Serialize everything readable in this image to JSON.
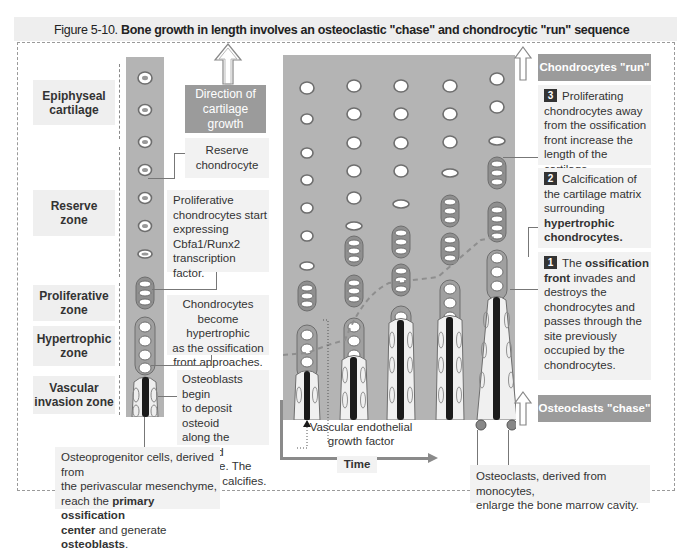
{
  "figure": {
    "number": "Figure 5-10.",
    "title": "Bone growth in length involves an osteoclastic \"chase\" and chondrocytic \"run\" sequence"
  },
  "zones": [
    {
      "id": "epiphyseal",
      "label_line1": "Epiphyseal",
      "label_line2": "cartilage"
    },
    {
      "id": "reserve",
      "label_line1": "Reserve",
      "label_line2": "zone"
    },
    {
      "id": "proliferative",
      "label_line1": "Proliferative",
      "label_line2": "zone"
    },
    {
      "id": "hypertrophic",
      "label_line1": "Hypertrophic",
      "label_line2": "zone"
    },
    {
      "id": "vascular",
      "label_line1": "Vascular",
      "label_line2": "invasion zone"
    }
  ],
  "direction_box": {
    "line1": "Direction of",
    "line2": "cartilage",
    "line3": "growth"
  },
  "callouts": {
    "reserve_chondrocyte": {
      "line1": "Reserve",
      "line2": "chondrocyte"
    },
    "proliferative": [
      "Proliferative",
      "chondrocytes start",
      "expressing",
      "Cbfa1/Runx2",
      "transcription factor."
    ],
    "hypertrophic": [
      "Chondrocytes",
      "become hypertrophic",
      "as the ossification",
      "front approaches."
    ],
    "osteoblasts": [
      "Osteoblasts begin",
      "to deposit osteoid",
      "along the calcified",
      "cartilage. The",
      "osteoid calcifies."
    ],
    "osteoprogenitor": {
      "line1": "Osteoprogenitor cells, derived from",
      "line2": "the perivascular mesenchyme,",
      "line3_pre": "reach the ",
      "line3_bold": "primary ossification",
      "line4_bold": "center",
      "line4_mid": " and generate ",
      "line4_bold2": "osteoblasts",
      "line4_end": "."
    },
    "vegf": {
      "line1": "Vascular endothelial",
      "line2": "growth factor"
    },
    "osteoclasts": {
      "line1": "Osteoclasts, derived from monocytes,",
      "line2": "enlarge the bone marrow cavity."
    }
  },
  "time_axis": {
    "label": "Time"
  },
  "right_panel": {
    "run_header": "Chondrocytes \"run\"",
    "chase_header": "Osteoclasts \"chase\"",
    "steps": [
      {
        "number": "3",
        "text_first": "Proliferating",
        "lines": [
          "chondrocytes away",
          "from the ossification",
          "front increase the",
          "length of the cartilage."
        ]
      },
      {
        "number": "2",
        "text_first": "Calcification of",
        "lines": [
          "the cartilage matrix",
          "surrounding"
        ],
        "bold_lines": [
          "hypertrophic",
          "chondrocytes."
        ]
      },
      {
        "number": "1",
        "text_first_pre": "The ",
        "text_first_bold": "ossification",
        "bold_line": "front",
        "bold_line_rest": " invades and",
        "lines": [
          "destroys the",
          "chondrocytes and",
          "passes through the",
          "site previously",
          "occupied by the",
          "chondrocytes."
        ]
      }
    ]
  },
  "colors": {
    "panel_grey": "#b4b4b4",
    "label_bg": "#efefef",
    "header_box": "#9b9b9b",
    "bone_dark": "#1a1a1a",
    "cell_outline": "#6e6e6e"
  }
}
